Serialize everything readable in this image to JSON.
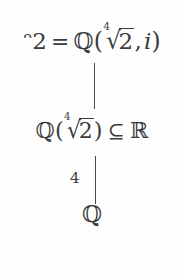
{
  "diagram": {
    "type": "field-extension-tower",
    "background_color": "#fefefe",
    "text_color": "#3b3b3b",
    "nodes": [
      {
        "id": "top",
        "role": "top-field",
        "full_text": "ᵔ2 = ℚ(⁴√2, i)",
        "parts": {
          "field_symbol": "ᵔ2",
          "equals": "=",
          "rationals": "ℚ",
          "open_paren": "(",
          "root_index": "4",
          "radical_sign": "√",
          "radicand": "2",
          "comma": ",",
          "imaginary_unit": "i",
          "close_paren": ")"
        }
      },
      {
        "id": "middle",
        "role": "intermediate-field",
        "full_text": "ℚ(⁴√2) ⊆ ℝ",
        "parts": {
          "rationals": "ℚ",
          "open_paren": "(",
          "root_index": "4",
          "radical_sign": "√",
          "radicand": "2",
          "close_paren": ")",
          "subset_symbol": "⊆",
          "reals": "ℝ"
        }
      },
      {
        "id": "bottom",
        "role": "base-field",
        "full_text": "ℚ",
        "parts": {
          "rationals": "ℚ"
        }
      }
    ],
    "edges": [
      {
        "id": "edge-upper",
        "from": "top",
        "to": "middle",
        "label": ""
      },
      {
        "id": "edge-lower",
        "from": "middle",
        "to": "bottom",
        "label": "4"
      }
    ]
  }
}
